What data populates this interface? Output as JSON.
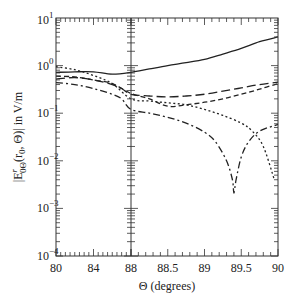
{
  "chart_data": {
    "type": "line",
    "title": "",
    "xlabel": "Θ (degrees)",
    "ylabel": "|Eʳ₀Θ(r₀, Θ)| in V/m",
    "ylabel_parts": {
      "main": "|E",
      "sup": "r",
      "sub": "0Θ",
      "rest": "(r",
      "rest_sub": "0",
      "tail": ", Θ)| in V/m"
    },
    "yscale": "log",
    "ylim": [
      0.0001,
      10
    ],
    "y_ticks": [
      {
        "value": 10,
        "label_base": "10",
        "label_exp": "1"
      },
      {
        "value": 1,
        "label_base": "10",
        "label_exp": "0"
      },
      {
        "value": 0.1,
        "label_base": "10",
        "label_exp": "−1"
      },
      {
        "value": 0.01,
        "label_base": "10",
        "label_exp": "−2"
      },
      {
        "value": 0.001,
        "label_base": "10",
        "label_exp": "−3"
      },
      {
        "value": 0.0001,
        "label_base": "10",
        "label_exp": "−4"
      }
    ],
    "x_axis": {
      "broken": true,
      "segments": [
        {
          "range": [
            80,
            88
          ],
          "ticks": [
            "80",
            "84",
            "88"
          ]
        },
        {
          "range": [
            88,
            90
          ],
          "ticks": [
            "88.5",
            "89",
            "89.5",
            "90"
          ]
        }
      ]
    },
    "grid": false,
    "legend": null,
    "series": [
      {
        "name": "solid",
        "style": "solid",
        "x": [
          80,
          82,
          84,
          86,
          88,
          88.25,
          88.5,
          88.75,
          89,
          89.25,
          89.5,
          89.75,
          90
        ],
        "y": [
          0.72,
          0.74,
          0.74,
          0.66,
          0.72,
          0.85,
          1.0,
          1.15,
          1.35,
          1.75,
          2.3,
          3.2,
          4.0
        ]
      },
      {
        "name": "long-dash",
        "style": "long-dash",
        "x": [
          80,
          82,
          84,
          86,
          87,
          88,
          88.25,
          88.5,
          88.75,
          89,
          89.25,
          89.5,
          89.75,
          90
        ],
        "y": [
          0.52,
          0.56,
          0.5,
          0.4,
          0.33,
          0.25,
          0.23,
          0.22,
          0.23,
          0.25,
          0.29,
          0.34,
          0.4,
          0.45
        ]
      },
      {
        "name": "dotted",
        "style": "dotted",
        "x": [
          80,
          82,
          84,
          86,
          88,
          88.25,
          88.5,
          88.75,
          89,
          89.25,
          89.5,
          89.65,
          89.8,
          89.95
        ],
        "y": [
          0.95,
          0.82,
          0.62,
          0.42,
          0.2,
          0.18,
          0.165,
          0.15,
          0.12,
          0.09,
          0.062,
          0.042,
          0.02,
          0.004
        ]
      },
      {
        "name": "short-dash",
        "style": "short-dash",
        "x": [
          80,
          82,
          84,
          86,
          88,
          88.25,
          88.5,
          88.75,
          89,
          89.25,
          89.5,
          89.75,
          90
        ],
        "y": [
          0.6,
          0.58,
          0.5,
          0.42,
          0.26,
          0.2,
          0.14,
          0.15,
          0.17,
          0.2,
          0.25,
          0.32,
          0.42
        ]
      },
      {
        "name": "dash-dot",
        "style": "dash-dot",
        "x": [
          80,
          82,
          84,
          86,
          87,
          88,
          88.25,
          88.5,
          88.75,
          89,
          89.15,
          89.3,
          89.38,
          89.4,
          89.43,
          89.5,
          89.6,
          89.75,
          90
        ],
        "y": [
          0.44,
          0.4,
          0.33,
          0.25,
          0.2,
          0.12,
          0.1,
          0.082,
          0.062,
          0.04,
          0.025,
          0.01,
          0.004,
          0.0021,
          0.004,
          0.012,
          0.025,
          0.042,
          0.058
        ]
      }
    ]
  }
}
